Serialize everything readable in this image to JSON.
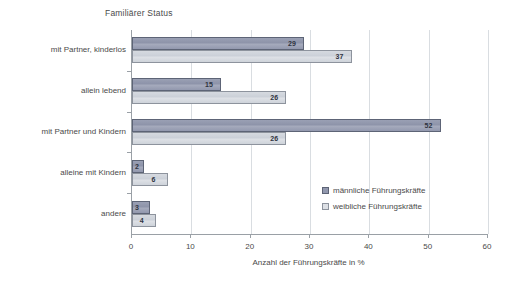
{
  "chart_data": {
    "type": "bar",
    "orientation": "horizontal",
    "title": "Familiärer Status",
    "xlabel": "Anzahl der Führungskräfte in %",
    "ylabel": "",
    "xlim": [
      0,
      60
    ],
    "xticks": [
      0,
      10,
      20,
      30,
      40,
      50,
      60
    ],
    "grid": true,
    "grid_axis": "x",
    "legend_position": "inside-right",
    "categories": [
      "mit Partner, kinderlos",
      "allein lebend",
      "mit Partner und Kindern",
      "alleine mit Kindern",
      "andere"
    ],
    "series": [
      {
        "name": "männliche Führungskräfte",
        "color": "#9298ae",
        "values": [
          29,
          15,
          52,
          2,
          3
        ]
      },
      {
        "name": "weibliche Führungskräfte",
        "color": "#ced3da",
        "values": [
          37,
          26,
          26,
          6,
          4
        ]
      }
    ]
  },
  "axis": {
    "tick_labels": [
      "0",
      "10",
      "20",
      "30",
      "40",
      "50",
      "60"
    ]
  },
  "legend": {
    "items": [
      {
        "label": "männliche Führungskräfte"
      },
      {
        "label": "weibliche Führungskräfte"
      }
    ]
  }
}
